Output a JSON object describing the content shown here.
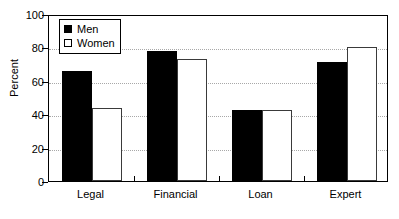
{
  "chart_data": {
    "type": "bar",
    "title": "",
    "subtitle": "",
    "xlabel": "",
    "ylabel": "Percent",
    "categories": [
      "Legal",
      "Financial",
      "Loan",
      "Expert"
    ],
    "series": [
      {
        "name": "Men",
        "values": [
          66,
          78,
          42.5,
          71.5
        ],
        "color": "#000000",
        "fill": "solid"
      },
      {
        "name": "Women",
        "values": [
          44,
          73,
          42.5,
          80.5
        ],
        "color": "#ffffff",
        "fill": "outline"
      }
    ],
    "ylim": [
      0,
      100
    ],
    "yticks": [
      0,
      20,
      40,
      60,
      80,
      100
    ],
    "ytick_labels": [
      "0",
      "20",
      "40",
      "60",
      "80",
      "100"
    ],
    "grid": true,
    "grid_axis": "y",
    "legend": true,
    "legend_position": "top-left-inside",
    "legend_entries": [
      "Men",
      "Women"
    ]
  },
  "axes": {
    "y_title": "Percent"
  }
}
